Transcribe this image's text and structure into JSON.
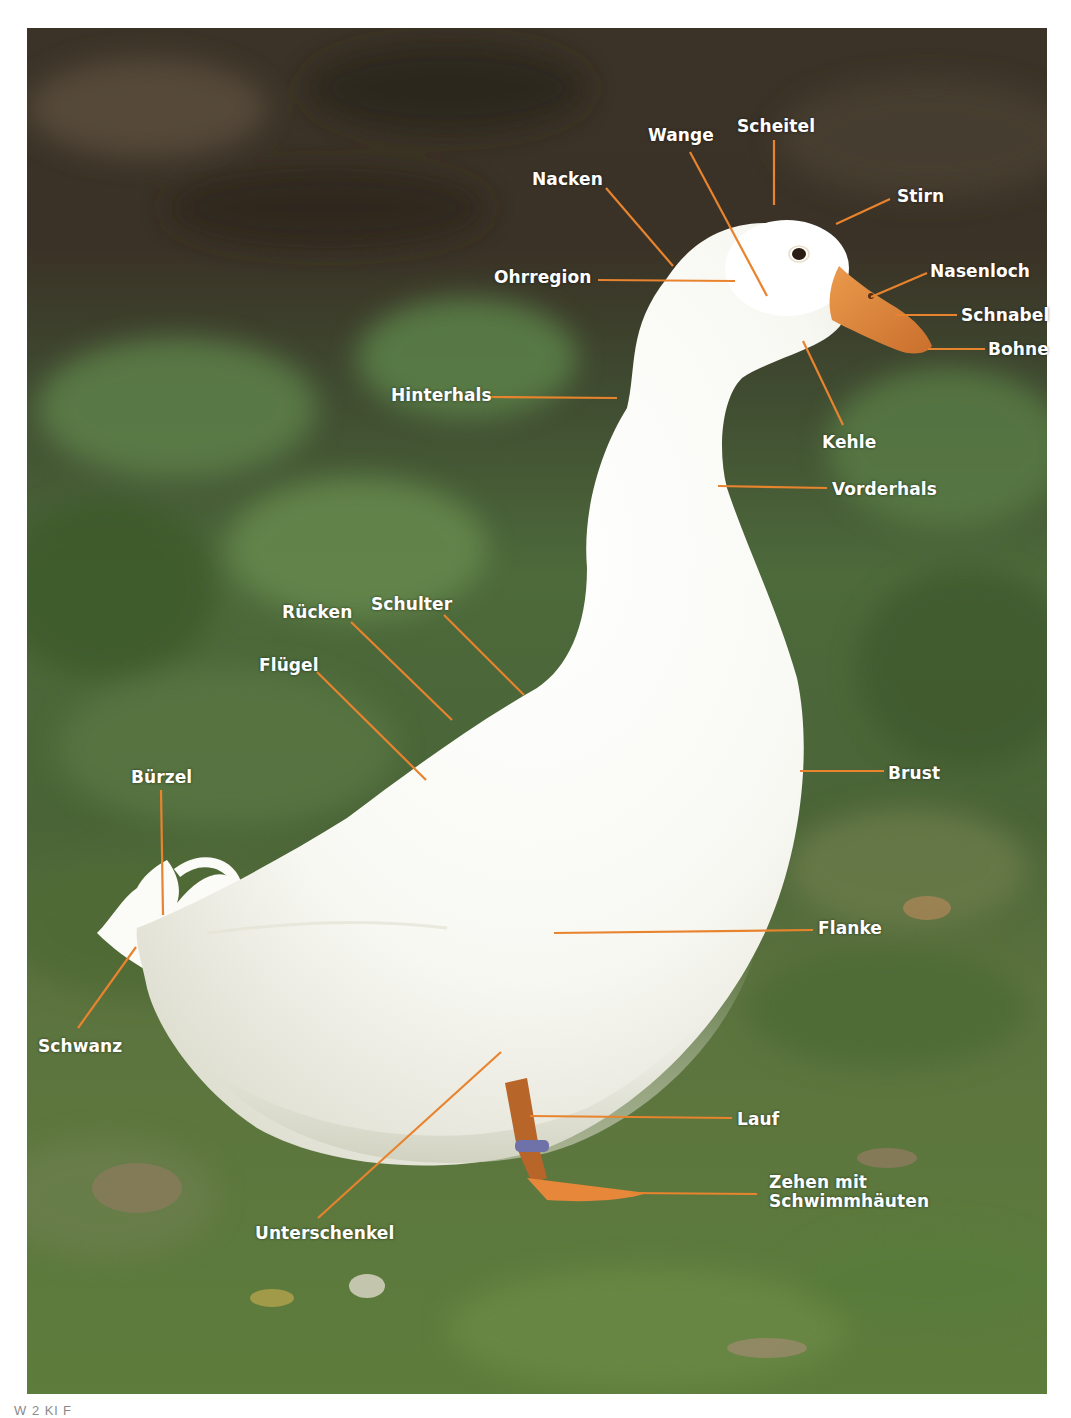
{
  "figure": {
    "caption_partial": "W          2   Kl       F                        ",
    "line_color": "#e8832e",
    "label_color": "#ffffff",
    "colors": {
      "bg_dark": "#3a3226",
      "bg_green": "#4c6a3a",
      "grass": "#5f7f3e",
      "plumage": "#fbfbf8",
      "beak": "#e0873f",
      "leg": "#b8652a",
      "leg_band": "#6f72a8"
    }
  },
  "labels": [
    {
      "id": "scheitel",
      "text": "Scheitel",
      "x": 737,
      "y": 117,
      "line": [
        774,
        140,
        774,
        205
      ]
    },
    {
      "id": "wange",
      "text": "Wange",
      "x": 648,
      "y": 126,
      "line": [
        690,
        152,
        767,
        296
      ]
    },
    {
      "id": "nacken",
      "text": "Nacken",
      "x": 532,
      "y": 170,
      "line": [
        606,
        188,
        673,
        266
      ]
    },
    {
      "id": "stirn",
      "text": "Stirn",
      "x": 897,
      "y": 187,
      "line": [
        890,
        199,
        836,
        224
      ]
    },
    {
      "id": "ohrregion",
      "text": "Ohrregion",
      "x": 494,
      "y": 268,
      "line": [
        598,
        280,
        735,
        281
      ]
    },
    {
      "id": "nasenloch",
      "text": "Nasenloch",
      "x": 930,
      "y": 262,
      "line": [
        927,
        273,
        871,
        297
      ]
    },
    {
      "id": "schnabel",
      "text": "Schnabel",
      "x": 961,
      "y": 306,
      "line": [
        957,
        315,
        895,
        315
      ]
    },
    {
      "id": "bohne",
      "text": "Bohne",
      "x": 988,
      "y": 340,
      "line": [
        985,
        349,
        928,
        349
      ]
    },
    {
      "id": "hinterhals",
      "text": "Hinterhals",
      "x": 391,
      "y": 386,
      "line": [
        491,
        397,
        617,
        398
      ]
    },
    {
      "id": "kehle",
      "text": "Kehle",
      "x": 822,
      "y": 433,
      "line": [
        843,
        425,
        803,
        341
      ]
    },
    {
      "id": "vorderhals",
      "text": "Vorderhals",
      "x": 832,
      "y": 480,
      "line": [
        827,
        488,
        718,
        486
      ]
    },
    {
      "id": "schulter",
      "text": "Schulter",
      "x": 371,
      "y": 595,
      "line": [
        444,
        615,
        524,
        695
      ]
    },
    {
      "id": "ruecken",
      "text": "Rücken",
      "x": 282,
      "y": 603,
      "line": [
        351,
        622,
        452,
        720
      ]
    },
    {
      "id": "fluegel",
      "text": "Flügel",
      "x": 259,
      "y": 656,
      "line": [
        317,
        672,
        426,
        780
      ]
    },
    {
      "id": "brust",
      "text": "Brust",
      "x": 888,
      "y": 764,
      "line": [
        800,
        771,
        884,
        771
      ]
    },
    {
      "id": "buerzel",
      "text": "Bürzel",
      "x": 131,
      "y": 768,
      "line": [
        161,
        790,
        163,
        915
      ]
    },
    {
      "id": "flanke",
      "text": "Flanke",
      "x": 818,
      "y": 919,
      "line": [
        554,
        933,
        813,
        930
      ]
    },
    {
      "id": "schwanz",
      "text": "Schwanz",
      "x": 38,
      "y": 1037,
      "line": [
        136,
        947,
        78,
        1028
      ]
    },
    {
      "id": "lauf",
      "text": "Lauf",
      "x": 737,
      "y": 1110,
      "line": [
        530,
        1116,
        732,
        1118
      ]
    },
    {
      "id": "zehen",
      "text": "Zehen mit\nSchwimmhäuten",
      "x": 769,
      "y": 1178,
      "line": [
        630,
        1193,
        757,
        1194
      ]
    },
    {
      "id": "unterschenkel",
      "text": "Unterschenkel",
      "x": 255,
      "y": 1224,
      "line": [
        501,
        1052,
        318,
        1218
      ]
    }
  ]
}
